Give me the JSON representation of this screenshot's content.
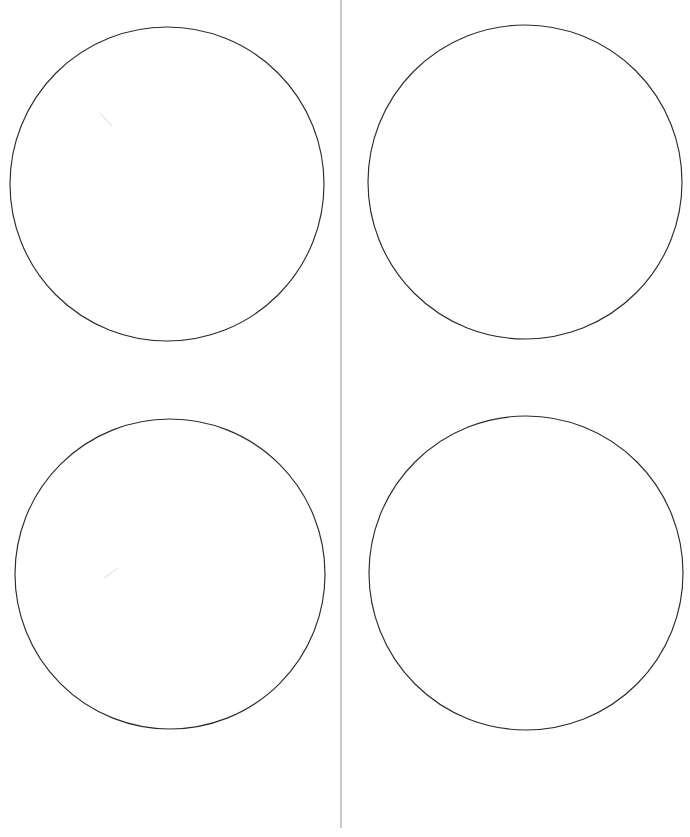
{
  "document": {
    "kind": "scanned-worksheet",
    "page_width": 690,
    "page_height": 837,
    "background_color": "#ffffff",
    "title": "",
    "header_text": "",
    "footer_text": ""
  },
  "palette": {
    "background": "#ffffff",
    "circle_stroke": "#2b2b2b",
    "fold_line": "#b9b9b9",
    "scan_streak": "#ececec"
  },
  "fold_line": {
    "name": "center-fold-line",
    "orientation": "vertical",
    "x": 341,
    "y_start": 0,
    "y_end": 828,
    "width": 1.6,
    "color": "#b9b9b9"
  },
  "shapes": [
    {
      "id": "circle-top-left",
      "label": "",
      "cx": 167,
      "cy": 184,
      "r": 157,
      "stroke": "#2b2b2b",
      "stroke_width": 1.15,
      "fill": "none"
    },
    {
      "id": "circle-top-right",
      "label": "",
      "cx": 525,
      "cy": 182,
      "r": 157,
      "stroke": "#2b2b2b",
      "stroke_width": 1.15,
      "fill": "none"
    },
    {
      "id": "circle-bottom-left",
      "label": "",
      "cx": 170,
      "cy": 574,
      "r": 155,
      "stroke": "#2b2b2b",
      "stroke_width": 1.15,
      "fill": "none"
    },
    {
      "id": "circle-bottom-right",
      "label": "",
      "cx": 526,
      "cy": 573,
      "r": 157,
      "stroke": "#2b2b2b",
      "stroke_width": 1.15,
      "fill": "none"
    }
  ],
  "artifacts": [
    {
      "id": "scan-streak-upper",
      "x1": 100,
      "y1": 113,
      "x2": 112,
      "y2": 126,
      "color": "#ececec"
    },
    {
      "id": "scan-streak-lower",
      "x1": 104,
      "y1": 578,
      "x2": 118,
      "y2": 568,
      "color": "#ececec"
    }
  ],
  "captions": {
    "top_left": "",
    "top_right": "",
    "bottom_left": "",
    "bottom_right": ""
  }
}
